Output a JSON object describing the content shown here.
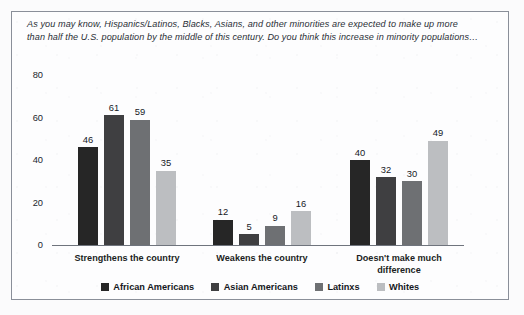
{
  "question": {
    "line1": "As you may know, Hispanics/Latinos, Blacks, Asians, and other minorities are expected to make up more",
    "line2": "than half the U.S. population by the middle of this century. Do you think this increase in minority populations…"
  },
  "axis": {
    "y_ticks": [
      "0",
      "20",
      "40",
      "60",
      "80"
    ]
  },
  "legend": {
    "items": [
      {
        "label": "African Americans",
        "color": "#262626"
      },
      {
        "label": "Asian Americans",
        "color": "#3f3f41"
      },
      {
        "label": "Latinxs",
        "color": "#6e7073"
      },
      {
        "label": "Whites",
        "color": "#bcbec1"
      }
    ]
  },
  "chart_data": {
    "type": "bar",
    "xlabel": "",
    "ylabel": "",
    "ylim": [
      0,
      80
    ],
    "yticks": [
      0,
      20,
      40,
      60,
      80
    ],
    "grid": false,
    "legend_position": "bottom",
    "categories": [
      "Strengthens the country",
      "Weakens the country",
      "Doesn't make much\ndifference"
    ],
    "series": [
      {
        "name": "African Americans",
        "color": "#262626",
        "values": [
          46,
          12,
          40
        ]
      },
      {
        "name": "Asian Americans",
        "color": "#3f3f41",
        "values": [
          61,
          5,
          32
        ]
      },
      {
        "name": "Latinxs",
        "color": "#6e7073",
        "values": [
          59,
          9,
          30
        ]
      },
      {
        "name": "Whites",
        "color": "#bcbec1",
        "values": [
          35,
          16,
          49
        ]
      }
    ]
  }
}
